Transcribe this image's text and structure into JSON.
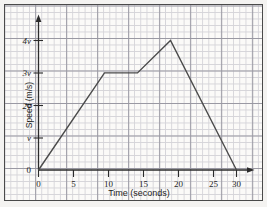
{
  "chart_data": {
    "type": "line",
    "title": "",
    "subtitle": "",
    "xlabel": "Time (seconds)",
    "ylabel": "Speed (m/s)",
    "xlim": [
      0,
      32
    ],
    "ylim": [
      0,
      4.6
    ],
    "grid": true,
    "legend": null,
    "x_ticks": [
      "0",
      "5",
      "10",
      "15",
      "20",
      "25",
      "30"
    ],
    "x_tick_values": [
      0,
      5,
      10,
      15,
      20,
      25,
      30
    ],
    "y_ticks": [
      "0",
      "v",
      "2v",
      "3v",
      "4v"
    ],
    "y_tick_values": [
      0,
      1,
      2,
      3,
      4
    ],
    "series": [
      {
        "name": "speed",
        "x": [
          0,
          10,
          15,
          20,
          30
        ],
        "values": [
          0,
          3,
          3,
          4,
          0
        ],
        "points": [
          {
            "t": 0,
            "v": 0,
            "label": "0"
          },
          {
            "t": 10,
            "v": 3,
            "label": "3v"
          },
          {
            "t": 15,
            "v": 3,
            "label": "3v"
          },
          {
            "t": 20,
            "v": 4,
            "label": "4v"
          },
          {
            "t": 30,
            "v": 0,
            "label": "0"
          }
        ],
        "color": "#4b4b4b"
      }
    ],
    "axis_arrows": {
      "x": true,
      "y": true
    }
  },
  "axes": {
    "x_title": "Time (seconds)",
    "y_title": "Speed (m/s)",
    "x_tick_labels": [
      "0",
      "5",
      "10",
      "15",
      "20",
      "25",
      "30"
    ],
    "y_tick_labels": [
      "4v",
      "3v",
      "2v",
      "v",
      "0"
    ]
  },
  "colors": {
    "paper": "#fbfaf8",
    "grid_minor": "#c9c8cf",
    "grid_major": "#8f8e99",
    "axis": "#2b2b2b",
    "line": "#4b4b4b",
    "text": "#1f1f1f"
  }
}
